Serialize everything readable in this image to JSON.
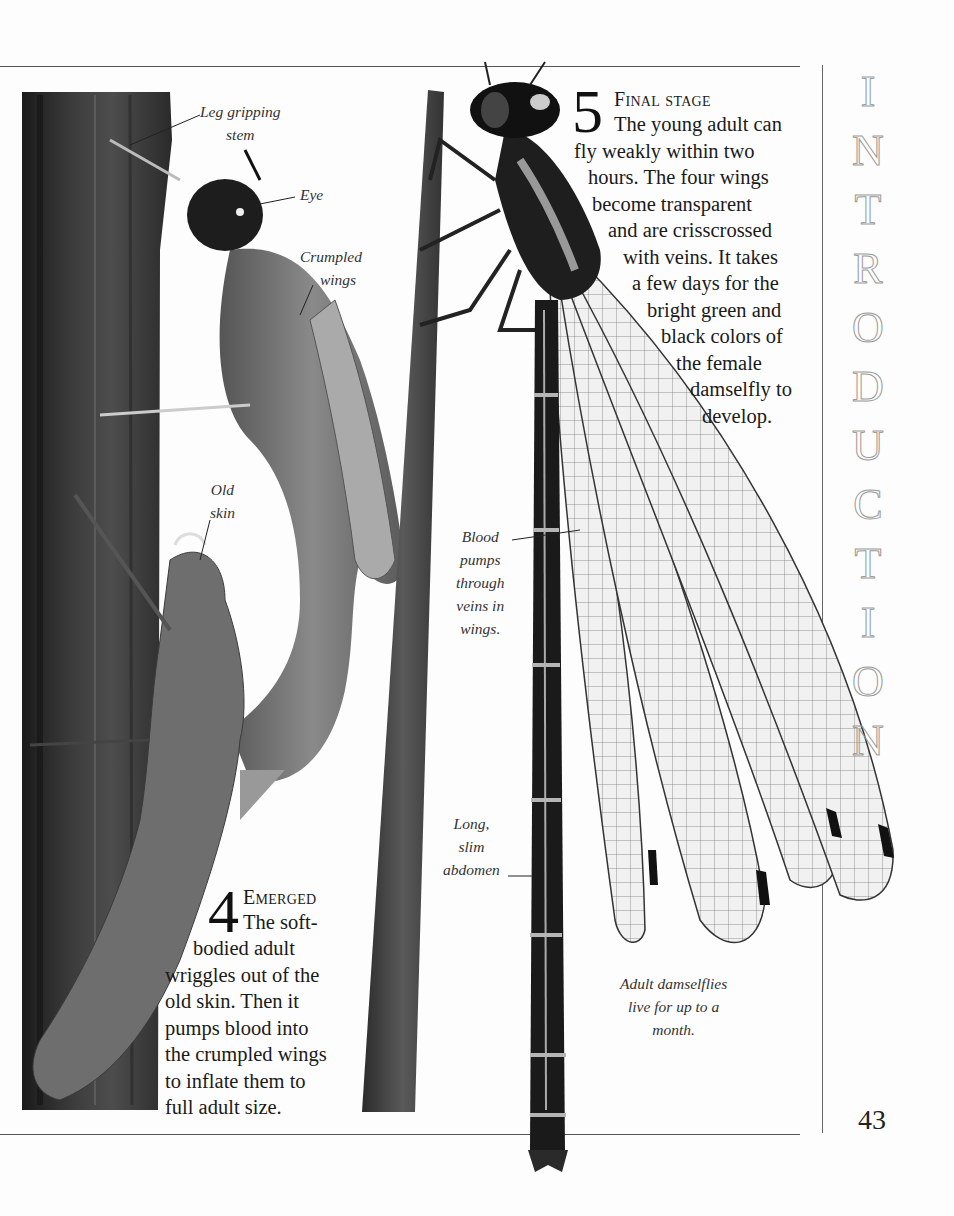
{
  "page": {
    "number": "43",
    "section_title": "INTRODUCTION",
    "section_title_letters": [
      "I",
      "N",
      "T",
      "R",
      "O",
      "D",
      "U",
      "C",
      "T",
      "I",
      "O",
      "N"
    ]
  },
  "stage5": {
    "number": "5",
    "heading": "Final stage",
    "lines": [
      "The young adult can",
      "fly weakly within two",
      "hours. The four wings",
      "become transparent",
      "and are crisscrossed",
      "with veins. It takes",
      "a few days for the",
      "bright green and",
      "black colors of",
      "the female",
      "damselfly to",
      "develop."
    ]
  },
  "stage4": {
    "number": "4",
    "heading": "Emerged",
    "lines": [
      "The soft-",
      "bodied adult",
      "wriggles out of the",
      "old skin. Then it",
      "pumps blood into",
      "the crumpled wings",
      "to inflate them to",
      "full adult size."
    ]
  },
  "labels": {
    "leg_gripping_stem": [
      "Leg gripping",
      "stem"
    ],
    "eye": [
      "Eye"
    ],
    "crumpled_wings": [
      "Crumpled",
      "wings"
    ],
    "old_skin": [
      "Old",
      "skin"
    ],
    "blood_pumps": [
      "Blood",
      "pumps",
      "through",
      "veins in",
      "wings."
    ],
    "long_slim_abdomen": [
      "Long,",
      "slim",
      "abdomen"
    ],
    "adult_caption": [
      "Adult damselflies",
      "live for up to a",
      "month."
    ]
  },
  "colors": {
    "paper": "#fdfdfd",
    "ink": "#1a1a1a",
    "rule": "#555555",
    "stem_dark": "#2a2a2a",
    "wing_vein": "#3a3a3a",
    "title_outline": "#9a9a9a"
  }
}
